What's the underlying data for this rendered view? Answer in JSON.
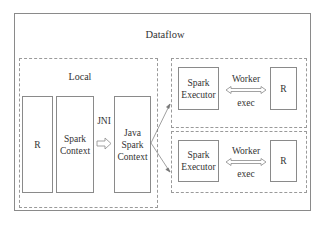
{
  "diagram": {
    "outer": {
      "title": "Dataflow"
    },
    "local": {
      "title": "Local",
      "boxes": [
        {
          "label": "R"
        },
        {
          "label": "Spark\nContext"
        },
        {
          "label": "Java\nSpark\nContext"
        }
      ],
      "connector_label": "JNI"
    },
    "workers": [
      {
        "executor_label": "Spark\nExecutor",
        "r_label": "R",
        "link_label_top": "Worker",
        "link_label_bottom": "exec"
      },
      {
        "executor_label": "Spark\nExecutor",
        "r_label": "R",
        "link_label_top": "Worker",
        "link_label_bottom": "exec"
      }
    ],
    "colors": {
      "border": "#8a8a8a",
      "dashed": "#9a9a9a",
      "text": "#333333",
      "background": "#ffffff"
    }
  }
}
